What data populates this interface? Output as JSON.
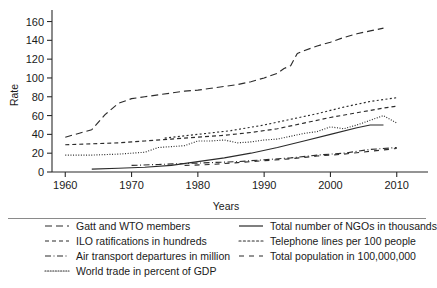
{
  "chart_data": {
    "type": "line",
    "title": "",
    "xlabel": "Years",
    "ylabel": "Rate",
    "xlim": [
      1958,
      2012
    ],
    "ylim": [
      0,
      168
    ],
    "xticks": [
      1960,
      1970,
      1980,
      1990,
      2000,
      2010
    ],
    "yticks": [
      0,
      20,
      40,
      60,
      80,
      100,
      120,
      140,
      160
    ],
    "grid": false,
    "legend_position": "below-plot-two-columns",
    "series": [
      {
        "name": "Gatt and WTO members",
        "dash": "long-dash",
        "x": [
          1960,
          1962,
          1964,
          1966,
          1968,
          1970,
          1972,
          1974,
          1976,
          1978,
          1980,
          1982,
          1984,
          1986,
          1988,
          1990,
          1992,
          1993,
          1994,
          1995,
          1996,
          1998,
          2000,
          2002,
          2004,
          2006,
          2008
        ],
        "values": [
          37,
          41,
          45,
          61,
          73,
          78,
          80,
          82,
          84,
          86,
          87,
          89,
          91,
          93,
          96,
          100,
          105,
          110,
          113,
          126,
          129,
          134,
          138,
          143,
          147,
          150,
          153
        ]
      },
      {
        "name": "ILO ratifications in hundreds",
        "dash": "short-dash",
        "x": [
          1960,
          1964,
          1968,
          1972,
          1976,
          1980,
          1984,
          1988,
          1992,
          1996,
          2000,
          2004,
          2008,
          2010
        ],
        "values": [
          29,
          30,
          31,
          33,
          35,
          37,
          39,
          42,
          46,
          52,
          58,
          63,
          68,
          70
        ]
      },
      {
        "name": "Air transport departures in million",
        "dash": "dash-dot",
        "x": [
          1970,
          1974,
          1978,
          1982,
          1986,
          1990,
          1994,
          1998,
          2002,
          2006,
          2010
        ],
        "values": [
          7,
          8,
          9,
          10,
          11,
          13,
          15,
          18,
          20,
          24,
          26
        ]
      },
      {
        "name": "World trade in percent of GDP",
        "dash": "dotted",
        "x": [
          1960,
          1964,
          1968,
          1970,
          1972,
          1974,
          1976,
          1978,
          1980,
          1982,
          1984,
          1986,
          1988,
          1990,
          1992,
          1994,
          1996,
          1998,
          2000,
          2002,
          2004,
          2006,
          2008,
          2010
        ],
        "values": [
          18,
          18,
          19,
          20,
          21,
          26,
          27,
          28,
          33,
          33,
          34,
          31,
          32,
          34,
          35,
          38,
          41,
          43,
          48,
          46,
          50,
          55,
          60,
          52
        ]
      },
      {
        "name": "Total number of NGOs in thousands",
        "dash": "solid",
        "x": [
          1964,
          1968,
          1972,
          1976,
          1980,
          1984,
          1988,
          1992,
          1996,
          2000,
          2004,
          2006,
          2008
        ],
        "values": [
          3,
          4,
          5,
          7,
          11,
          15,
          20,
          26,
          33,
          40,
          47,
          50,
          50
        ]
      },
      {
        "name": "Telephone lines per 100 people",
        "dash": "fine-dash",
        "x": [
          1975,
          1980,
          1985,
          1990,
          1994,
          1998,
          2002,
          2006,
          2010
        ],
        "values": [
          36,
          40,
          44,
          50,
          56,
          62,
          69,
          75,
          79
        ]
      },
      {
        "name": "Total population in 100,000,000",
        "dash": "sparse-dash",
        "x": [
          1978,
          1982,
          1986,
          1990,
          1994,
          1998,
          2002,
          2006,
          2010
        ],
        "values": [
          7,
          8,
          10,
          12,
          14,
          17,
          19,
          22,
          25
        ]
      }
    ]
  },
  "axes": {
    "ylabel": "Rate",
    "xlabel": "Years",
    "ytick_labels": [
      "0",
      "20",
      "40",
      "60",
      "80",
      "100",
      "120",
      "140",
      "160"
    ],
    "xtick_labels": [
      "1960",
      "1970",
      "1980",
      "1990",
      "2000",
      "2010"
    ]
  },
  "legend": {
    "left_column": [
      {
        "label": "Gatt and WTO members",
        "style": "long-dash"
      },
      {
        "label": "ILO ratifications in hundreds",
        "style": "short-dash"
      },
      {
        "label": "Air transport departures in million",
        "style": "dash-dot"
      },
      {
        "label": "World trade in percent of GDP",
        "style": "dotted"
      }
    ],
    "right_column": [
      {
        "label": "Total number of NGOs in thousands",
        "style": "solid"
      },
      {
        "label": "Telephone lines per 100 people",
        "style": "fine-dash"
      },
      {
        "label": "Total population in 100,000,000",
        "style": "sparse-dash"
      }
    ]
  },
  "colors": {
    "ink": "#2b2b2b",
    "background": "#ffffff",
    "divider": "#8a8a8a"
  }
}
